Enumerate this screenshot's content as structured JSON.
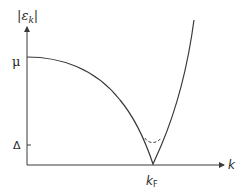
{
  "diagram": {
    "y_axis": {
      "label_main": "ε",
      "label_sub": "k",
      "label_bars": "|"
    },
    "x_axis": {
      "label": "k"
    },
    "y_ticks": [
      {
        "name": "mu",
        "label": "μ"
      },
      {
        "name": "delta",
        "label": "Δ"
      }
    ],
    "x_ticks": [
      {
        "name": "fermi-wavevector",
        "label_main": "k",
        "label_sub": "F"
      }
    ],
    "curves": [
      {
        "name": "normal-state-dispersion",
        "style": "solid",
        "description": "|ε_k| decreasing from μ at k=0 to zero at k_F, then rising"
      },
      {
        "name": "gapped-dispersion",
        "style": "dashed",
        "description": "gapped spectrum with minimum Δ near k_F"
      }
    ],
    "colors": {
      "line": "#3a3a3a",
      "text": "#2a2a2a",
      "background": "#ffffff"
    }
  }
}
